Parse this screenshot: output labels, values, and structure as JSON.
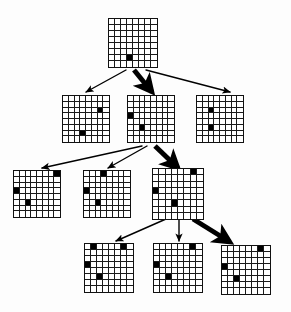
{
  "diagram": {
    "type": "tree-diagram",
    "canvas": {
      "width": 291,
      "height": 312,
      "background": "#fdfdfd"
    },
    "grid": {
      "rows": 8,
      "cols": 8,
      "cell_on_color": "#000000",
      "cell_off_color": "#ffffff",
      "line_color": "#1a1a1a"
    },
    "arrow_color": "#000000",
    "levels": [
      {
        "index": 0,
        "label": "root"
      },
      {
        "index": 1,
        "label": "depth-1"
      },
      {
        "index": 2,
        "label": "depth-2"
      },
      {
        "index": 3,
        "label": "depth-3"
      }
    ],
    "nodes": [
      {
        "id": "n0",
        "name": "root-state",
        "level": 0,
        "x": 108,
        "y": 18,
        "size": 50,
        "filled_cells": [
          [
            6,
            3
          ]
        ]
      },
      {
        "id": "n1a",
        "name": "depth1-state-left",
        "level": 1,
        "x": 62,
        "y": 95,
        "size": 48,
        "filled_cells": [
          [
            2,
            6
          ],
          [
            6,
            3
          ]
        ]
      },
      {
        "id": "n1b",
        "name": "depth1-state-middle",
        "level": 1,
        "x": 127,
        "y": 95,
        "size": 48,
        "filled_cells": [
          [
            3,
            0
          ],
          [
            5,
            2
          ]
        ]
      },
      {
        "id": "n1c",
        "name": "depth1-state-right",
        "level": 1,
        "x": 196,
        "y": 95,
        "size": 48,
        "filled_cells": [
          [
            2,
            2
          ],
          [
            5,
            2
          ]
        ]
      },
      {
        "id": "n2a",
        "name": "depth2-state-left",
        "level": 2,
        "x": 13,
        "y": 170,
        "size": 48,
        "filled_cells": [
          [
            0,
            7
          ],
          [
            3,
            0
          ],
          [
            5,
            2
          ]
        ]
      },
      {
        "id": "n2b",
        "name": "depth2-state-middle",
        "level": 2,
        "x": 83,
        "y": 170,
        "size": 48,
        "filled_cells": [
          [
            0,
            3
          ],
          [
            3,
            0
          ],
          [
            5,
            2
          ]
        ]
      },
      {
        "id": "n2c",
        "name": "depth2-state-right",
        "level": 2,
        "x": 152,
        "y": 168,
        "size": 52,
        "filled_cells": [
          [
            0,
            6
          ],
          [
            3,
            0
          ],
          [
            5,
            3
          ]
        ]
      },
      {
        "id": "n3a",
        "name": "depth3-state-left",
        "level": 3,
        "x": 84,
        "y": 243,
        "size": 50,
        "filled_cells": [
          [
            0,
            1
          ],
          [
            0,
            6
          ],
          [
            3,
            0
          ],
          [
            5,
            2
          ]
        ]
      },
      {
        "id": "n3b",
        "name": "depth3-state-middle",
        "level": 3,
        "x": 153,
        "y": 243,
        "size": 50,
        "filled_cells": [
          [
            0,
            6
          ],
          [
            3,
            0
          ],
          [
            5,
            2
          ]
        ]
      },
      {
        "id": "n3c",
        "name": "depth3-state-right",
        "level": 3,
        "x": 221,
        "y": 245,
        "size": 50,
        "filled_cells": [
          [
            0,
            6
          ],
          [
            3,
            0
          ],
          [
            5,
            2
          ]
        ]
      }
    ],
    "edges": [
      {
        "id": "e0a",
        "name": "edge-root-to-left",
        "from": "n0",
        "to": "n1a",
        "x1": 126,
        "y1": 70,
        "x2": 86,
        "y2": 92,
        "bold": false
      },
      {
        "id": "e0b",
        "name": "edge-root-to-middle",
        "from": "n0",
        "to": "n1b",
        "x1": 134,
        "y1": 70,
        "x2": 152,
        "y2": 92,
        "bold": true
      },
      {
        "id": "e0c",
        "name": "edge-root-to-right",
        "from": "n0",
        "to": "n1c",
        "x1": 146,
        "y1": 70,
        "x2": 230,
        "y2": 92,
        "bold": false
      },
      {
        "id": "e1a",
        "name": "edge-middle-to-left",
        "from": "n1b",
        "to": "n2a",
        "x1": 142,
        "y1": 146,
        "x2": 42,
        "y2": 168,
        "bold": false
      },
      {
        "id": "e1b",
        "name": "edge-middle-to-middle",
        "from": "n1b",
        "to": "n2b",
        "x1": 147,
        "y1": 146,
        "x2": 108,
        "y2": 168,
        "bold": false
      },
      {
        "id": "e1c",
        "name": "edge-middle-to-right",
        "from": "n1b",
        "to": "n2c",
        "x1": 155,
        "y1": 146,
        "x2": 178,
        "y2": 168,
        "bold": true
      },
      {
        "id": "e2a",
        "name": "edge-right-to-left",
        "from": "n2c",
        "to": "n3a",
        "x1": 166,
        "y1": 219,
        "x2": 116,
        "y2": 241,
        "bold": false
      },
      {
        "id": "e2b",
        "name": "edge-right-to-middle",
        "from": "n2c",
        "to": "n3b",
        "x1": 179,
        "y1": 219,
        "x2": 179,
        "y2": 241,
        "bold": false
      },
      {
        "id": "e2c",
        "name": "edge-right-to-right",
        "from": "n2c",
        "to": "n3c",
        "x1": 193,
        "y1": 219,
        "x2": 230,
        "y2": 242,
        "bold": true
      }
    ]
  }
}
